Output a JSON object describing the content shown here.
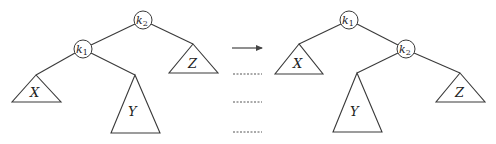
{
  "diagram": {
    "before": {
      "root": {
        "key": "k",
        "sub": "2"
      },
      "child": {
        "key": "k",
        "sub": "1"
      },
      "subtrees": {
        "x": "X",
        "y": "Y",
        "z": "Z"
      }
    },
    "after": {
      "root": {
        "key": "k",
        "sub": "1"
      },
      "child": {
        "key": "k",
        "sub": "2"
      },
      "subtrees": {
        "x": "X",
        "y": "Y",
        "z": "Z"
      }
    },
    "connector": {
      "arrow": "right-arrow",
      "dashed_lines": 3
    },
    "colors": {
      "stroke": "#3a3a3a",
      "text": "#222222",
      "background": "#ffffff"
    }
  }
}
